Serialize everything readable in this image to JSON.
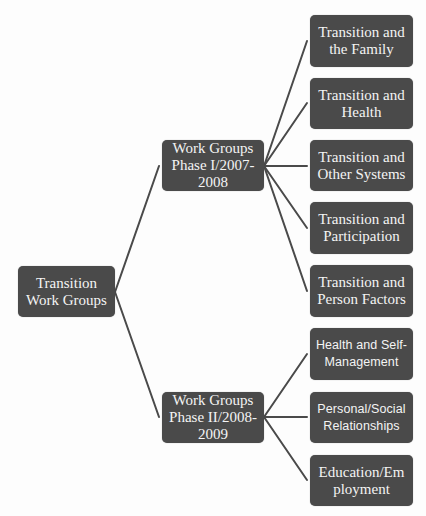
{
  "diagram": {
    "type": "tree",
    "root": {
      "id": "root",
      "label": "Transition\nWork Groups"
    },
    "phases": [
      {
        "id": "phase1",
        "label": "Work Groups\nPhase I/2007-\n2008",
        "children": [
          {
            "id": "p1c1",
            "label": "Transition and\nthe Family"
          },
          {
            "id": "p1c2",
            "label": "Transition and\nHealth"
          },
          {
            "id": "p1c3",
            "label": "Transition and\nOther Systems"
          },
          {
            "id": "p1c4",
            "label": "Transition and\nParticipation"
          },
          {
            "id": "p1c5",
            "label": "Transition and\nPerson Factors"
          }
        ]
      },
      {
        "id": "phase2",
        "label": "Work Groups\nPhase II/2008-\n2009",
        "children": [
          {
            "id": "p2c1",
            "label": "Health and Self-\nManagement"
          },
          {
            "id": "p2c2",
            "label": "Personal/Social\nRelationships"
          },
          {
            "id": "p2c3",
            "label": "Education/Em\nployment"
          }
        ]
      }
    ],
    "colors": {
      "node_fill": "#4a4a4a",
      "node_text": "#f4f4f4",
      "connector": "#4a4a4a",
      "background": "#fdfdfd"
    }
  }
}
